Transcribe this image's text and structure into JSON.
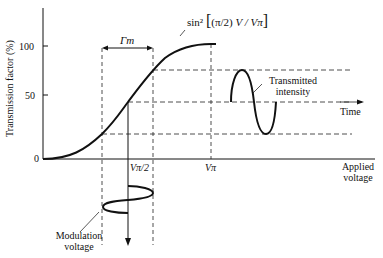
{
  "diagram": {
    "y_axis": {
      "label": "Transmission factor (%)",
      "ticks": [
        "100",
        "50",
        "0"
      ]
    },
    "x_axis": {
      "label_line1": "Applied",
      "label_line2": "voltage",
      "ticks": [
        "Vπ/2",
        "Vπ"
      ]
    },
    "curve_formula": {
      "prefix": "sin²",
      "bracket_open": "[",
      "pi_frac": "(π/2)",
      "v_frac": "V / Vπ",
      "bracket_close": "]"
    },
    "gamma_label": "Γm",
    "transmitted": {
      "line1": "Transmitted",
      "line2": "intensity"
    },
    "time_label": "Time",
    "modulation": {
      "line1": "Modulation",
      "line2": "voltage"
    }
  }
}
